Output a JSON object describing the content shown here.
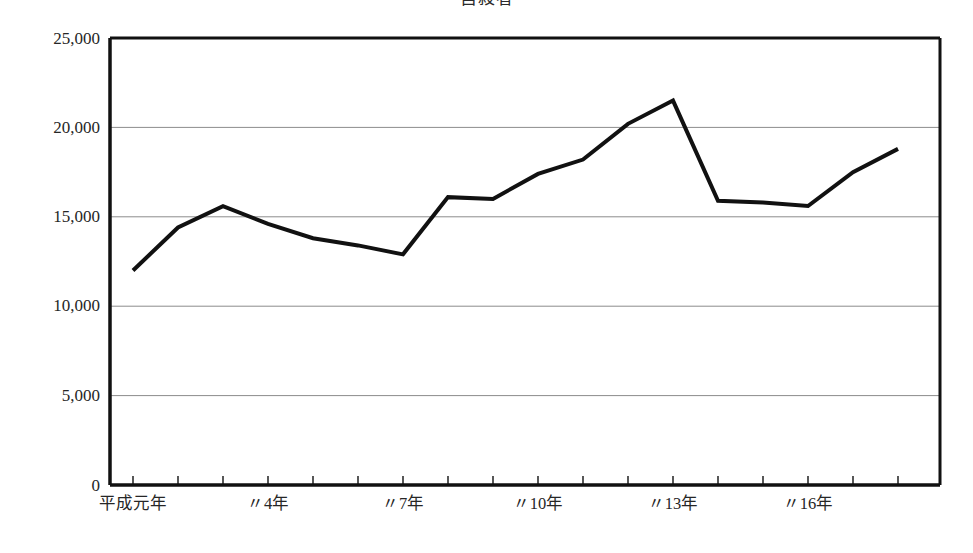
{
  "chart_data": {
    "type": "line",
    "title": "自殺者",
    "xlabel": "",
    "ylabel": "",
    "grid": true,
    "legend": false,
    "ylim": [
      0,
      25000
    ],
    "ytick_labels": [
      "25,000",
      "20,000",
      "15,000",
      "10,000",
      "5,000",
      "0"
    ],
    "ytick_values": [
      25000,
      20000,
      15000,
      10000,
      5000,
      0
    ],
    "xtick_labels": [
      "平成元年",
      "〃4年",
      "〃7年",
      "〃10年",
      "〃13年",
      "〃16年"
    ],
    "xtick_indices": [
      0,
      3,
      6,
      9,
      12,
      15
    ],
    "categories": [
      "平成元年",
      "〃2年",
      "〃3年",
      "〃4年",
      "〃5年",
      "〃6年",
      "〃7年",
      "〃8年",
      "〃9年",
      "〃10年",
      "〃11年",
      "〃12年",
      "〃13年",
      "〃14年",
      "〃15年",
      "〃16年",
      "〃17年",
      "〃18年"
    ],
    "series": [
      {
        "name": "自殺者",
        "color": "#111111",
        "values": [
          12000,
          14400,
          15600,
          14600,
          13800,
          13400,
          12900,
          16100,
          16000,
          17400,
          18200,
          20200,
          21500,
          15900,
          15800,
          15600,
          17500,
          18800
        ]
      }
    ],
    "line_width": 4,
    "colors": {
      "line": "#111111",
      "axis": "#111111",
      "grid": "#8c8c8c",
      "background": "#ffffff",
      "text": "#262626"
    }
  }
}
